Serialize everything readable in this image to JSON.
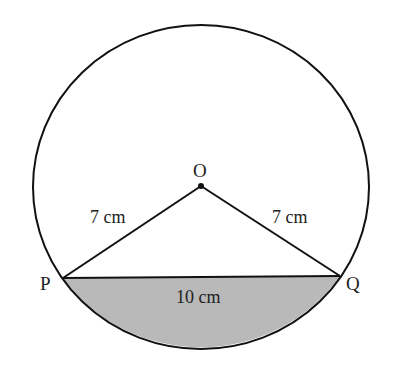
{
  "diagram": {
    "points": {
      "O": {
        "label": "O",
        "x": 201,
        "y": 186
      },
      "P": {
        "label": "P",
        "x": 63,
        "y": 278
      },
      "Q": {
        "label": "Q",
        "x": 340,
        "y": 276
      }
    },
    "circle": {
      "cx": 201,
      "cy": 187,
      "rx": 168,
      "ry": 162
    },
    "labels": {
      "OP": "7 cm",
      "OQ": "7 cm",
      "PQ": "10 cm"
    },
    "colors": {
      "stroke": "#111111",
      "shading": "#b8b8b8"
    }
  }
}
